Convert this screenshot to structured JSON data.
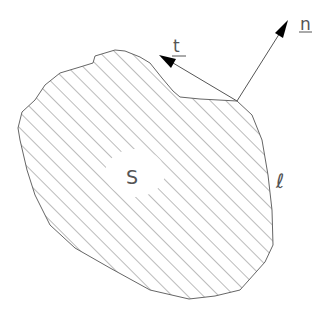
{
  "diagram": {
    "type": "region-with-boundary-vectors",
    "labels": {
      "region": "S",
      "boundary": "ℓ",
      "normal": "n",
      "tangent": "t"
    },
    "colors": {
      "stroke": "#666666",
      "hatch": "#777777",
      "arrow": "#000000",
      "background": "#ffffff"
    },
    "vectors": [
      {
        "name": "normal",
        "label": "n",
        "from": [
          237,
          101
        ],
        "to": [
          288,
          20
        ]
      },
      {
        "name": "tangent",
        "label": "t",
        "from": [
          237,
          101
        ],
        "to": [
          159,
          55
        ]
      }
    ]
  }
}
